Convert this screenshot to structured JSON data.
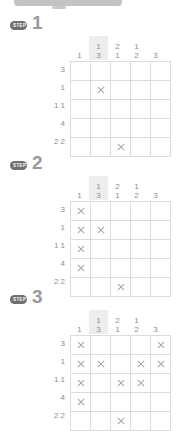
{
  "page": {
    "puzzle_type": "nonogram",
    "grid_size": 5,
    "badge_label": "STEP"
  },
  "clues": {
    "columns": [
      {
        "top": "",
        "bottom": "1",
        "highlight": false
      },
      {
        "top": "1",
        "bottom": "3",
        "highlight": true
      },
      {
        "top": "2",
        "bottom": "1",
        "highlight": false
      },
      {
        "top": "1",
        "bottom": "2",
        "highlight": false
      },
      {
        "top": "",
        "bottom": "3",
        "highlight": false
      }
    ],
    "rows": [
      "3",
      "1",
      "1 1",
      "4",
      "2 2"
    ]
  },
  "steps": [
    {
      "number": "1",
      "cells": [
        [
          "empty",
          "fill",
          "empty",
          "empty",
          "empty"
        ],
        [
          "empty",
          "cross",
          "empty",
          "empty",
          "empty"
        ],
        [
          "empty",
          "fill",
          "empty",
          "empty",
          "empty"
        ],
        [
          "empty",
          "fill",
          "empty",
          "empty",
          "empty"
        ],
        [
          "fill",
          "fill",
          "cross",
          "fill",
          "fill"
        ]
      ]
    },
    {
      "number": "2",
      "cells": [
        [
          "cross",
          "fill",
          "empty",
          "empty",
          "empty"
        ],
        [
          "cross",
          "cross",
          "empty",
          "empty",
          "empty"
        ],
        [
          "cross",
          "fill",
          "empty",
          "empty",
          "empty"
        ],
        [
          "cross",
          "fill",
          "empty",
          "empty",
          "empty"
        ],
        [
          "fill",
          "fill",
          "cross",
          "fill",
          "fill"
        ]
      ]
    },
    {
      "number": "3",
      "cells": [
        [
          "cross",
          "fill",
          "fill",
          "fill",
          "cross"
        ],
        [
          "cross",
          "cross",
          "fill",
          "cross",
          "cross"
        ],
        [
          "cross",
          "fill",
          "cross",
          "cross",
          "fill"
        ],
        [
          "cross",
          "fill",
          "fill",
          "fill",
          "fill"
        ],
        [
          "fill",
          "fill",
          "cross",
          "fill",
          "fill"
        ]
      ]
    }
  ],
  "colors": {
    "badge_bg": "#6f6f6f",
    "text": "#8d8d8d",
    "grid_line": "#dcdcdc",
    "grid_border": "#b5b5b5",
    "fill": "#b9b9b9",
    "highlight": "#ededed"
  }
}
